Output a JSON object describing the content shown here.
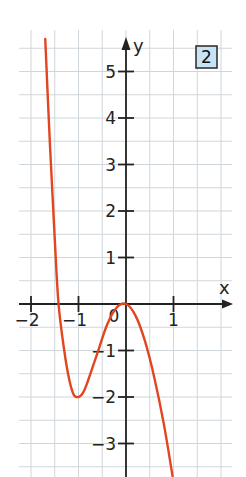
{
  "badge": {
    "label": "2",
    "fill": "#c7e4f6",
    "border": "#333333"
  },
  "colors": {
    "curve": "#e2451f",
    "grid": "#cfd6dc",
    "axis": "#222222"
  },
  "chart_data": {
    "type": "line",
    "title": "",
    "xlabel": "x",
    "ylabel": "y",
    "xlim": [
      -2.2,
      2.2
    ],
    "ylim": [
      -3.7,
      5.7
    ],
    "grid": true,
    "grid_step": 0.5,
    "x_ticks": [
      -2,
      -1,
      0,
      1
    ],
    "x_tick_labels": [
      "-2",
      "-1",
      "0",
      "1"
    ],
    "y_ticks": [
      -3,
      -2,
      -1,
      1,
      2,
      3,
      4,
      5
    ],
    "y_tick_labels": [
      "−3",
      "−2",
      "−1",
      "1",
      "2",
      "3",
      "4",
      "5"
    ],
    "origin_label": "0",
    "series": [
      {
        "name": "f(x)",
        "x": [
          -1.7,
          -1.6,
          -1.5,
          -1.42,
          -1.3,
          -1.2,
          -1.1,
          -1.0,
          -0.9,
          -0.8,
          -0.6,
          -0.4,
          -0.2,
          0.0,
          0.2,
          0.4,
          0.6,
          0.8,
          0.98
        ],
        "y": [
          5.7,
          3.4,
          1.4,
          0.0,
          -1.0,
          -1.6,
          -1.95,
          -2.0,
          -1.9,
          -1.65,
          -1.05,
          -0.45,
          -0.08,
          0.0,
          -0.25,
          -0.8,
          -1.6,
          -2.6,
          -3.7
        ]
      }
    ],
    "annotations": [
      "local maximum at (0, 0)",
      "local minimum at (-1, -2)"
    ]
  }
}
